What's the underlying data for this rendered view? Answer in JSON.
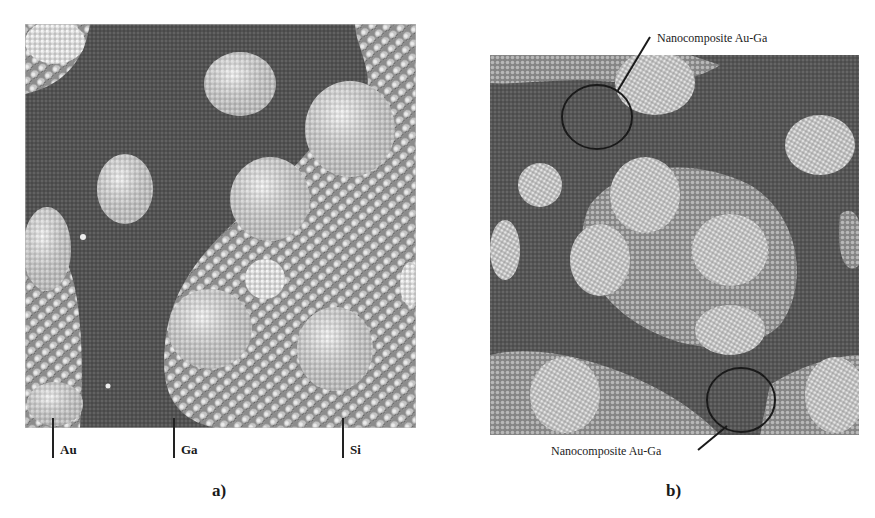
{
  "figure": {
    "panel_a": {
      "caption": "a)",
      "labels": [
        {
          "text": "Au",
          "x": 52
        },
        {
          "text": "Ga",
          "x": 174
        },
        {
          "text": "Si",
          "x": 342
        }
      ]
    },
    "panel_b": {
      "caption": "b)",
      "annotations": [
        {
          "text": "Nanocomposite Au-Ga",
          "position": "top"
        },
        {
          "text": "Nanocomposite Au-Ga",
          "position": "bottom"
        }
      ]
    }
  },
  "colors": {
    "ga_matrix": "#555555",
    "si_substrate": "#9a9a9a",
    "au_cluster": "#d8d8d8",
    "annotation_line": "#222222"
  }
}
